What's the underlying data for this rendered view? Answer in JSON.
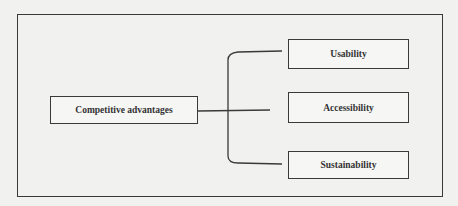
{
  "diagram": {
    "root": {
      "label": "Competitive advantages"
    },
    "children": [
      {
        "label": "Usability"
      },
      {
        "label": "Accessibility"
      },
      {
        "label": "Sustainability"
      }
    ],
    "colors": {
      "line": "#3a3a3a",
      "background": "#f1f1ef",
      "text": "#333333"
    }
  }
}
